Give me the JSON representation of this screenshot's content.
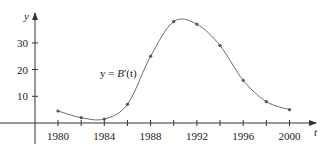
{
  "chart_data": {
    "type": "line",
    "title": "",
    "xlabel": "t",
    "ylabel": "y",
    "curve_label": "y = B′(t)",
    "curve_label_parts": {
      "prefix": "y = ",
      "func": "B",
      "suffix": "′(t)"
    },
    "x_ticks": [
      1980,
      1982,
      1984,
      1986,
      1988,
      1990,
      1992,
      1994,
      1996,
      1998,
      2000
    ],
    "x_tick_labels": [
      "1980",
      "1984",
      "1988",
      "1992",
      "1996",
      "2000"
    ],
    "y_ticks": [
      10,
      20,
      30
    ],
    "y_tick_labels": [
      "10",
      "20",
      "30"
    ],
    "xlim": [
      1975,
      2002
    ],
    "ylim": [
      -7,
      42
    ],
    "grid": false,
    "legend": "none",
    "series": [
      {
        "name": "B'(t)",
        "x": [
          1980,
          1982,
          1984,
          1986,
          1988,
          1990,
          1992,
          1994,
          1996,
          1998,
          2000
        ],
        "values": [
          4.5,
          2,
          1.5,
          7,
          25,
          38,
          37,
          29,
          16,
          8,
          5
        ]
      }
    ],
    "colors": {
      "curve": "#6e6e6e",
      "markers": "#555555",
      "axes": "#333333"
    }
  }
}
